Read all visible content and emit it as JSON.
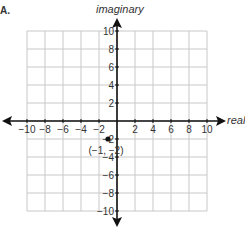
{
  "problem": {
    "option_label": "A."
  },
  "chart_data": {
    "type": "scatter",
    "title": "",
    "xlabel": "real",
    "ylabel": "imaginary",
    "xlim": [
      -10,
      10
    ],
    "ylim": [
      -10,
      10
    ],
    "grid": true,
    "grid_step": 2,
    "x_ticks": [
      "−10",
      "−8",
      "−6",
      "−4",
      "−2",
      "2",
      "4",
      "6",
      "8",
      "10"
    ],
    "y_ticks": [
      "10",
      "8",
      "6",
      "4",
      "2",
      "−2",
      "−4",
      "−6",
      "−8",
      "−10"
    ],
    "points": [
      {
        "x": -1,
        "y": -2,
        "label": "(−1, −2)"
      }
    ],
    "colors": {
      "grid": "#c8c8c8",
      "axis": "#111111",
      "point": "#111111"
    }
  }
}
